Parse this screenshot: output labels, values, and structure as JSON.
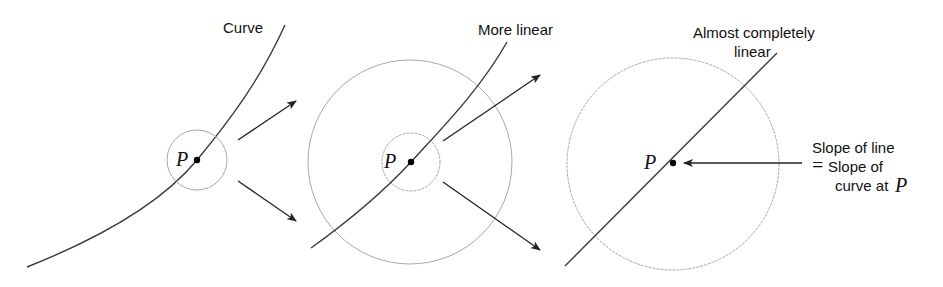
{
  "diagram": {
    "panels": [
      {
        "id": "panel-1",
        "label": "Curve",
        "point_label": "P",
        "circle": {
          "cx": 197,
          "cy": 160,
          "r": 30
        }
      },
      {
        "id": "panel-2",
        "label": "More linear",
        "point_label": "P",
        "circles": [
          {
            "cx": 410,
            "cy": 162,
            "r": 29
          },
          {
            "cx": 410,
            "cy": 162,
            "r": 102
          }
        ]
      },
      {
        "id": "panel-3",
        "label_line1": "Almost completely",
        "label_line2": "linear",
        "point_label": "P",
        "circle": {
          "cx": 673,
          "cy": 163,
          "r": 107
        },
        "annotation": {
          "line1": "Slope of line",
          "equals": "=",
          "line2": "Slope of",
          "line3": "curve at",
          "line3_var": "P"
        }
      }
    ],
    "colors": {
      "curve": "#3a3a3a",
      "circle": "#a8a8a8",
      "arrow": "#222222",
      "point": "#000000"
    }
  }
}
